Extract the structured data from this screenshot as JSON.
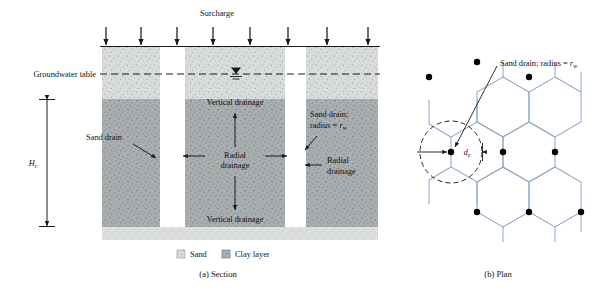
{
  "figure": {
    "title_section": "(a) Section",
    "title_plan": "(b) Plan"
  },
  "section": {
    "surcharge_label": "Surcharge",
    "groundwater_label": "Groundwater table",
    "height_symbol": "H",
    "height_subscript": "c",
    "sand_drain_label": "Sand drain",
    "vertical_drainage_top": "Vertical drainage",
    "vertical_drainage_bottom": "Vertical drainage",
    "radial_drainage_center_line1": "Radial",
    "radial_drainage_center_line2": "drainage",
    "radial_drainage_right_line1": "Radial",
    "radial_drainage_right_line2": "drainage",
    "sand_drain_radius_line1": "Sand drain;",
    "sand_drain_radius_line2_prefix": "radius = ",
    "sand_drain_radius_symbol": "r",
    "sand_drain_radius_subscript": "w",
    "arrow_count": 8
  },
  "legend": {
    "sand_label": "Sand",
    "clay_label": "Clay layer",
    "sand_color": "#d9dcdd",
    "clay_color": "#a9aeb0"
  },
  "plan": {
    "callout_prefix": "Sand drain; radius = ",
    "callout_symbol": "r",
    "callout_subscript": "w",
    "diameter_symbol": "d",
    "diameter_subscript": "e",
    "hex_line_color": "#8fa8c8",
    "drain_dot_color": "#000000"
  },
  "colors": {
    "sand_fill": "#d9dcdd",
    "clay_fill": "#a9aeb0",
    "base_sand_fill": "#dcdedf",
    "line": "#1a1a1a",
    "hex": "#8fa8c8"
  }
}
